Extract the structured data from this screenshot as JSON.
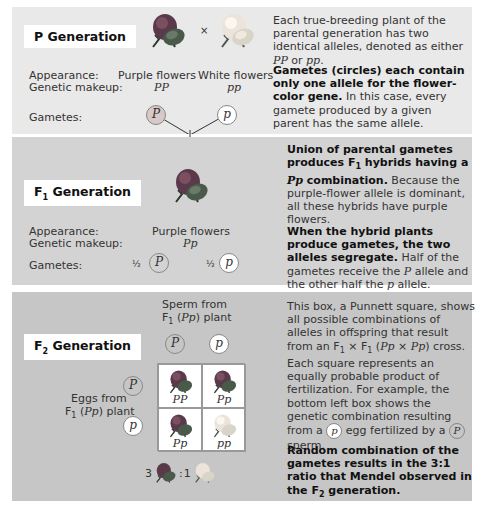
{
  "p_generation": {
    "title": "P Generation",
    "cross_symbol": "×",
    "labels": {
      "appearance": "Appearance:",
      "genetic_makeup": "Genetic makeup:",
      "gametes": "Gametes:"
    },
    "parent1": {
      "appearance": "Purple flowers",
      "genotype": "PP",
      "gamete": "P",
      "color": "purple"
    },
    "parent2": {
      "appearance": "White flowers",
      "genotype": "pp",
      "gamete": "p",
      "color": "white"
    },
    "desc1": {
      "pre": "Each true-breeding plant of the parental generation has two identical alleles, denoted as either ",
      "g1": "PP",
      "mid": " or ",
      "g2": "pp",
      "post": "."
    },
    "desc2": {
      "bold": "Gametes (circles) each contain only one allele for the flower-color gene.",
      "text": " In this case, every gamete produced by a given parent has the same allele."
    }
  },
  "f1_generation": {
    "title_main": "F",
    "title_sub": "1",
    "title_rest": " Generation",
    "labels": {
      "appearance": "Appearance:",
      "genetic_makeup": "Genetic makeup:",
      "gametes": "Gametes:"
    },
    "appearance": "Purple flowers",
    "genotype": "Pp",
    "gametes": [
      {
        "fraction": "½",
        "allele": "P"
      },
      {
        "fraction": "½",
        "allele": "p"
      }
    ],
    "desc1": {
      "bold1": "Union of parental gametes produces F",
      "sub": "1",
      "bold2": " hybrids having a ",
      "geno": "Pp",
      "bold3": " combination.",
      "text": " Because the purple-flower allele is dominant, all these hybrids have purple flowers."
    },
    "desc2": {
      "bold": "When the hybrid plants produce gametes, the two alleles segregate.",
      "pre": " Half of the gametes receive the ",
      "a1": "P",
      "mid": " allele and the other half the ",
      "a2": "p",
      "post": " allele."
    }
  },
  "f2_generation": {
    "title_main": "F",
    "title_sub": "2",
    "title_rest": " Generation",
    "sperm_label": {
      "line1": "Sperm from",
      "line2_pre": "F",
      "line2_sub": "1",
      "line2_geno": "Pp",
      "line2_post": " plant"
    },
    "eggs_label": {
      "line1": "Eggs from",
      "line2_pre": "F",
      "line2_sub": "1",
      "line2_geno": "Pp",
      "line2_post": " plant"
    },
    "sperm_alleles": [
      "P",
      "p"
    ],
    "egg_alleles": [
      "P",
      "p"
    ],
    "punnett": [
      {
        "genotype": "PP",
        "color": "purple"
      },
      {
        "genotype": "Pp",
        "color": "purple"
      },
      {
        "genotype": "Pp",
        "color": "purple"
      },
      {
        "genotype": "pp",
        "color": "white"
      }
    ],
    "ratio": {
      "purple_count": "3",
      "separator": ":",
      "white_count": "1"
    },
    "desc1": {
      "t1": "This box, a Punnett square, shows all possible combinations of alleles in offspring that result from an F",
      "s1": "1",
      "t2": " × F",
      "s2": "1",
      "t3": " (",
      "g1": "Pp",
      "t4": " × ",
      "g2": "Pp",
      "t5": ") cross. Each square represents an equally probable product of fertilization. For example, the bottom left box shows the genetic combination resulting from a ",
      "c1": "p",
      "t6": " egg fertilized by a ",
      "c2": "P",
      "t7": " sperm."
    },
    "desc2": {
      "bold1": "Random combination of the gametes results in the 3:1 ratio that Mendel observed in the F",
      "sub": "2",
      "bold2": " generation."
    }
  },
  "colors": {
    "purple_flower": "#5a3a4a",
    "purple_leaf": "#3a4a3a",
    "white_flower": "#ece4da",
    "dominant_gamete": "#d8c8c8",
    "recessive_gamete": "#ffffff"
  }
}
